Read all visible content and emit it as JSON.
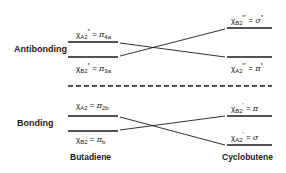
{
  "diagram": {
    "type": "orbital-correlation-diagram",
    "regions": {
      "antibonding_label": "Antibonding",
      "bonding_label": "Bonding"
    },
    "molecules": {
      "left_label": "Butadiene",
      "right_label": "Cyclobutene"
    },
    "butadiene_levels": [
      {
        "id": "pi4a",
        "symmetry": "A",
        "sym_sub": "2",
        "star": "*",
        "prime": "",
        "equals": "=",
        "orbital": "π",
        "orbital_sub": "4a",
        "orbital_sup": "",
        "label_position": "above"
      },
      {
        "id": "pi3a",
        "symmetry": "B",
        "sym_sub": "2",
        "star": "*",
        "prime": "",
        "equals": "=",
        "orbital": "π",
        "orbital_sub": "3a",
        "orbital_sup": "",
        "label_position": "below"
      },
      {
        "id": "pi2b",
        "symmetry": "A",
        "sym_sub": "2",
        "star": "",
        "prime": "",
        "equals": "=",
        "orbital": "π",
        "orbital_sub": "2b",
        "orbital_sup": "",
        "label_position": "above"
      },
      {
        "id": "pib",
        "symmetry": "B",
        "sym_sub": "2",
        "star": "",
        "prime": "",
        "equals": "=",
        "orbital": "π",
        "orbital_sub": "b",
        "orbital_sup": "",
        "label_position": "below"
      }
    ],
    "cyclobutene_levels": [
      {
        "id": "sigma-star",
        "symmetry": "B",
        "sym_sub": "2",
        "star": "*",
        "prime": "′",
        "equals": "=",
        "orbital": "σ",
        "orbital_sub": "",
        "orbital_sup": "*",
        "label_position": "above"
      },
      {
        "id": "pi-star",
        "symmetry": "A",
        "sym_sub": "2",
        "star": "*",
        "prime": "′",
        "equals": "=",
        "orbital": "π",
        "orbital_sub": "",
        "orbital_sup": "*",
        "label_position": "below"
      },
      {
        "id": "pi",
        "symmetry": "B",
        "sym_sub": "2",
        "star": "",
        "prime": "′",
        "equals": "=",
        "orbital": "π",
        "orbital_sub": "",
        "orbital_sup": "",
        "label_position": "above"
      },
      {
        "id": "sigma",
        "symmetry": "A",
        "sym_sub": "2",
        "star": "",
        "prime": "′",
        "equals": "=",
        "orbital": "σ",
        "orbital_sub": "",
        "orbital_sup": "",
        "label_position": "above"
      }
    ],
    "correlations": [
      {
        "from": "pi4a",
        "to": "pi-star"
      },
      {
        "from": "pi3a",
        "to": "sigma-star"
      },
      {
        "from": "pi2b",
        "to": "sigma"
      },
      {
        "from": "pib",
        "to": "pi"
      }
    ],
    "separator": "dashed"
  },
  "text": {
    "chi": "χ",
    "b_l1": {
      "sym": "A",
      "sub": "2",
      "sup": "*",
      "orb": "π",
      "orb_sub": "4a"
    },
    "b_l2": {
      "sym": "B",
      "sub": "2",
      "sup": "*",
      "orb": "π",
      "orb_sub": "3a"
    },
    "b_l3": {
      "sym": "A",
      "sub": "2",
      "sup": "",
      "orb": "π",
      "orb_sub": "2b"
    },
    "b_l4": {
      "sym": "B",
      "sub": "2",
      "sup": "",
      "orb": "π",
      "orb_sub": "b"
    },
    "c_l1": {
      "sym": "B",
      "sub": "2",
      "sup": "*′",
      "orb": "σ",
      "orb_sup": "*"
    },
    "c_l2": {
      "sym": "A",
      "sub": "2",
      "sup": "*′",
      "orb": "π",
      "orb_sup": "*"
    },
    "c_l3": {
      "sym": "B",
      "sub": "2",
      "sup": "′",
      "orb": "π",
      "orb_sup": ""
    },
    "c_l4": {
      "sym": "A",
      "sub": "2",
      "sup": "′",
      "orb": "σ",
      "orb_sup": ""
    },
    "eq": "="
  }
}
